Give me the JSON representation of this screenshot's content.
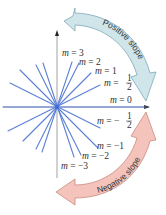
{
  "diagram": {
    "origin": [
      57,
      107
    ],
    "colors": {
      "line": "#5b7fd6",
      "axis": "#8a8a8a",
      "positive_arrow_fill": "#cfe5ea",
      "positive_arrow_stroke": "#7fa9b6",
      "negative_arrow_fill": "#f4c4bc",
      "negative_arrow_stroke": "#c98a80"
    },
    "slopes": [
      {
        "m": 3,
        "label": "m = 3"
      },
      {
        "m": 2,
        "label": "m = 2"
      },
      {
        "m": 1,
        "label": "m = 1"
      },
      {
        "m": 0.5,
        "label": "m = 1/2"
      },
      {
        "m": 0,
        "label": "m = 0"
      },
      {
        "m": -0.5,
        "label": "m = -1/2"
      },
      {
        "m": -1,
        "label": "m = -1"
      },
      {
        "m": -2,
        "label": "m = -2"
      },
      {
        "m": -3,
        "label": "m = -3"
      }
    ],
    "labels": {
      "m3": "m = 3",
      "m2": "m = 2",
      "m1": "m = 1",
      "mhalf_prefix": "m = ",
      "mhalf_num": "1",
      "mhalf_den": "2",
      "m0": "m = 0",
      "mneghalf_prefix": "m = −",
      "mneghalf_num": "1",
      "mneghalf_den": "2",
      "mneg1": "m = −1",
      "mneg2": "m = −2",
      "mneg3": "m = −3"
    },
    "arrows": {
      "positive": "Positive slope",
      "negative": "Negative slope"
    }
  }
}
